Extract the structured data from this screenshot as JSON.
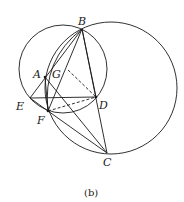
{
  "figure": {
    "caption": "(b)",
    "points": {
      "A": {
        "label": "A",
        "x": 45,
        "y": 77
      },
      "B": {
        "label": "B",
        "x": 82,
        "y": 29
      },
      "C": {
        "label": "C",
        "x": 107,
        "y": 153
      },
      "D": {
        "label": "D",
        "x": 96,
        "y": 97
      },
      "E": {
        "label": "E",
        "x": 30,
        "y": 98
      },
      "F": {
        "label": "F",
        "x": 48,
        "y": 111
      },
      "G": {
        "label": "G",
        "x": 50,
        "y": 72
      }
    },
    "circles": [
      {
        "name": "left-circle",
        "cx": 63,
        "cy": 69,
        "r": 44
      },
      {
        "name": "right-circle",
        "cx": 111,
        "cy": 88,
        "r": 66
      }
    ],
    "inner_arc": "B-F arc",
    "solid_segments": [
      "BE",
      "BF",
      "BA",
      "BC",
      "BD",
      "EA",
      "ED",
      "AF",
      "AC",
      "FC",
      "AD"
    ],
    "dashed_segments": [
      "GD",
      "FD"
    ],
    "stroke_color": "#1a1a1a"
  }
}
